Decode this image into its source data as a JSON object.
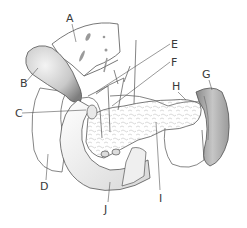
{
  "diagram": {
    "type": "anatomical-illustration",
    "labels": [
      {
        "id": "A",
        "text": "A",
        "x": 66,
        "y": 13,
        "target": "liver"
      },
      {
        "id": "B",
        "text": "B",
        "x": 20,
        "y": 78,
        "target": "gallbladder"
      },
      {
        "id": "C",
        "text": "C",
        "x": 15,
        "y": 108,
        "target": "common bile duct"
      },
      {
        "id": "D",
        "text": "D",
        "x": 40,
        "y": 181,
        "target": "kidney (right)"
      },
      {
        "id": "E",
        "text": "E",
        "x": 171,
        "y": 39,
        "target": "hepatic artery"
      },
      {
        "id": "F",
        "text": "F",
        "x": 171,
        "y": 57,
        "target": "portal vein"
      },
      {
        "id": "G",
        "text": "G",
        "x": 202,
        "y": 69,
        "target": "spleen"
      },
      {
        "id": "H",
        "text": "H",
        "x": 172,
        "y": 81,
        "target": "splenic artery"
      },
      {
        "id": "I",
        "text": "I",
        "x": 159,
        "y": 193,
        "target": "pancreas"
      },
      {
        "id": "J",
        "text": "J",
        "x": 104,
        "y": 204,
        "target": "duodenum"
      }
    ],
    "colors": {
      "line": "#555555",
      "label": "#3a3a3a",
      "background": "#ffffff",
      "shade": "#bdbdbd"
    }
  }
}
